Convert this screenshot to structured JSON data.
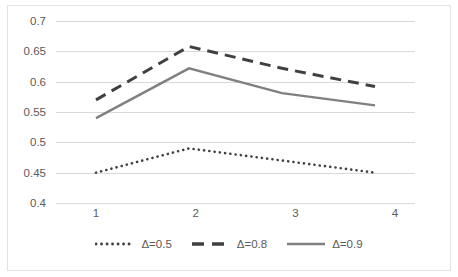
{
  "chart_data": {
    "type": "line",
    "title": "",
    "subtitle": "",
    "xlabel": "",
    "ylabel": "",
    "categories": [
      "1",
      "2",
      "3",
      "4"
    ],
    "x": [
      1,
      2,
      3,
      4
    ],
    "ylim": [
      0.4,
      0.7
    ],
    "ytick_labels": [
      "0.7",
      "0.65",
      "0.6",
      "0.55",
      "0.5",
      "0.45",
      "0.4"
    ],
    "yticks": [
      0.7,
      0.65,
      0.6,
      0.55,
      0.5,
      0.45,
      0.4
    ],
    "grid": true,
    "legend_position": "bottom",
    "series": [
      {
        "name": "Δ=0.5",
        "values": [
          0.45,
          0.49,
          0.47,
          0.45
        ],
        "style": "dotted",
        "color": "#404040"
      },
      {
        "name": "Δ=0.8",
        "values": [
          0.57,
          0.658,
          0.622,
          0.592
        ],
        "style": "dashed",
        "color": "#404040"
      },
      {
        "name": "Δ=0.9",
        "values": [
          0.54,
          0.622,
          0.581,
          0.561
        ],
        "style": "solid",
        "color": "#808080"
      }
    ]
  },
  "axes": {
    "y_labels": [
      "0.7",
      "0.65",
      "0.6",
      "0.55",
      "0.5",
      "0.45",
      "0.4"
    ],
    "x_labels": [
      "1",
      "2",
      "3",
      "4"
    ]
  },
  "legend": {
    "items": [
      {
        "label": "Δ=0.5",
        "style": "dotted",
        "color": "#404040"
      },
      {
        "label": "Δ=0.8",
        "style": "dashed",
        "color": "#404040"
      },
      {
        "label": "Δ=0.9",
        "style": "solid",
        "color": "#808080"
      }
    ]
  },
  "colors": {
    "gridline": "#d9d9d9",
    "border": "#e2e2e2",
    "tick_text": "#5a5a5a",
    "series_dark": "#404040",
    "series_gray": "#808080",
    "background": "#ffffff"
  }
}
